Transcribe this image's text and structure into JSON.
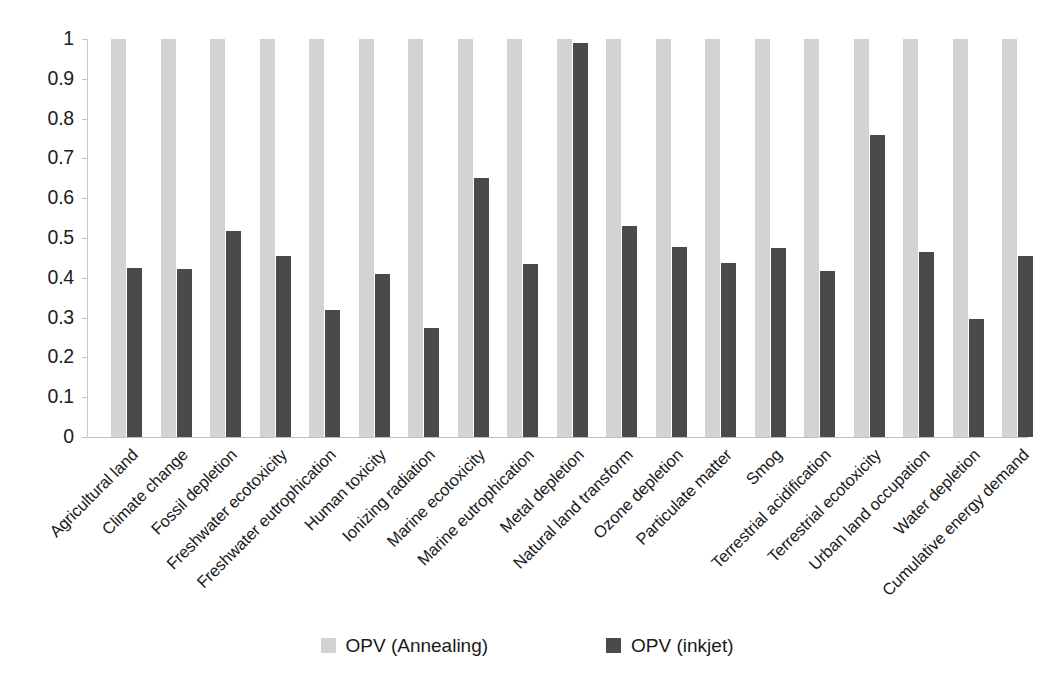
{
  "chart_data": {
    "type": "bar",
    "title": "",
    "subtitle": "",
    "xlabel": "",
    "ylabel": "",
    "ylim": [
      0,
      1
    ],
    "yticks": [
      "0",
      "0.1",
      "0.2",
      "0.3",
      "0.4",
      "0.5",
      "0.6",
      "0.7",
      "0.8",
      "0.9",
      "1"
    ],
    "ytick_values": [
      0,
      0.1,
      0.2,
      0.3,
      0.4,
      0.5,
      0.6,
      0.7,
      0.8,
      0.9,
      1
    ],
    "grid": false,
    "legend_position": "bottom-center",
    "categories": [
      "Agricultural land",
      "Climate change",
      "Fossil depletion",
      "Freshwater ecotoxicity",
      "Freshwater eutrophication",
      "Human toxicity",
      "Ionizing radiation",
      "Marine ecotoxicity",
      "Marine eutrophication",
      "Metal depletion",
      "Natural land transform",
      "Ozone depletion",
      "Particulate matter",
      "Smog",
      "Terrestrial acidification",
      "Terrestrial ecotoxicity",
      "Urban land occupation",
      "Water depletion",
      "Cumulative energy demand"
    ],
    "series": [
      {
        "name": "OPV (Annealing)",
        "color": "#d3d3d3",
        "values": [
          1,
          1,
          1,
          1,
          1,
          1,
          1,
          1,
          1,
          1,
          1,
          1,
          1,
          1,
          1,
          1,
          1,
          1,
          1
        ]
      },
      {
        "name": "OPV (inkjet)",
        "color": "#4a4a4a",
        "values": [
          0.425,
          0.423,
          0.518,
          0.455,
          0.32,
          0.41,
          0.275,
          0.65,
          0.435,
          0.99,
          0.53,
          0.477,
          0.438,
          0.476,
          0.416,
          0.76,
          0.465,
          0.296,
          0.455
        ]
      }
    ]
  },
  "legend": {
    "items": [
      {
        "label": "OPV (Annealing)",
        "color": "#d3d3d3",
        "swatch_name": "legend-swatch-opv-annealing"
      },
      {
        "label": "OPV (inkjet)",
        "color": "#4a4a4a",
        "swatch_name": "legend-swatch-opv-inkjet"
      }
    ]
  }
}
